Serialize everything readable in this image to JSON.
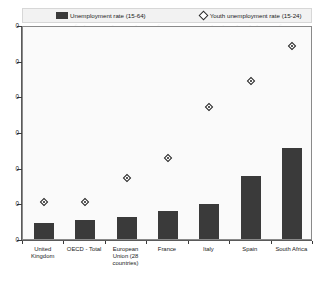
{
  "legend": {
    "items": [
      {
        "label": "Unemployment rate (15-64)",
        "marker": "bar-swatch",
        "color": "#3a3a3a"
      },
      {
        "label": "Youth unemployment rate (15-24)",
        "marker": "diamond",
        "color": "#1f1f1f"
      }
    ]
  },
  "background_text": "percentage of the total number of young people in the labour force. The youth unemployment rate is in most countries higher than the overall unemployment rate, as shown in the chart. Across OECD countries the youth unemployment rate stood at around twice the level of the adult rate. In 2014 it reached 53.2% in Greece, 53.2% in Italy and 23.9% in France, while in the United Kingdom the rate was much lower. In South Africa the rate of youth unemployment is one of the highest in the world, reflecting structural weaknesses in the labour market and a mismatch between skills supply and demand. The bar chart below compares the unemployment rate for the working age population aged 15 to 64 with the youth unemployment rate for those aged 15 to 24 across a selection of countries and country groupings.",
  "chart_data": {
    "type": "bar",
    "title": "",
    "xlabel": "",
    "ylabel": "",
    "ylim": [
      0,
      60
    ],
    "yticks": [
      0,
      10,
      20,
      30,
      40,
      50,
      60
    ],
    "ytick_labels": [
      "0",
      "10",
      "20",
      "30",
      "40",
      "50",
      "60"
    ],
    "ytick_labels_clipped": [
      "0",
      "0",
      "0",
      "0",
      "0",
      "0",
      "0"
    ],
    "grid": false,
    "legend_position": "top",
    "categories": [
      "United Kingdom",
      "OECD - Total",
      "European Union (28 countries)",
      "France",
      "Italy",
      "Spain",
      "South Africa"
    ],
    "series": [
      {
        "name": "Unemployment rate (15-64)",
        "type": "bar",
        "color": "#3a3a3a",
        "values": [
          4.5,
          5.2,
          6.2,
          7.8,
          9.7,
          17.8,
          25.4
        ]
      },
      {
        "name": "Youth unemployment rate (15-24)",
        "type": "scatter",
        "color": "#1f1f1f",
        "values": [
          10.8,
          10.8,
          17.6,
          23.2,
          37.6,
          44.9,
          54.6
        ]
      }
    ]
  }
}
